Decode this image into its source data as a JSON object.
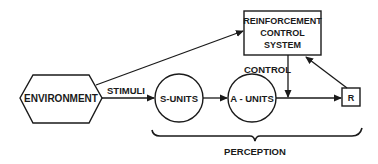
{
  "diagram": {
    "nodes": {
      "environment": {
        "label": "ENVIRONMENT",
        "shape": "hexagon"
      },
      "reinforcement": {
        "line1": "REINFORCEMENT",
        "line2": "CONTROL",
        "line3": "SYSTEM",
        "shape": "rectangle"
      },
      "s_units": {
        "label": "S-UNITS",
        "shape": "circle"
      },
      "a_units": {
        "label": "A - UNITS",
        "shape": "circle"
      },
      "r": {
        "label": "R",
        "shape": "square"
      }
    },
    "edges": {
      "stimuli": {
        "label": "STIMULI",
        "from": "environment",
        "to": "s_units"
      },
      "env_to_reinforcement": {
        "label": "",
        "from": "environment",
        "to": "reinforcement"
      },
      "s_to_a": {
        "label": "",
        "from": "s_units",
        "to": "a_units"
      },
      "a_to_r": {
        "label": "",
        "from": "a_units",
        "to": "r"
      },
      "control": {
        "label": "CONTROL",
        "from": "reinforcement",
        "to": "a_to_r"
      },
      "r_to_reinforcement": {
        "label": "",
        "from": "r",
        "to": "reinforcement"
      }
    },
    "brace": {
      "label": "PERCEPTION",
      "spans": [
        "s_units",
        "a_units",
        "r"
      ]
    },
    "colors": {
      "stroke": "#1a1a1a",
      "background": "#ffffff"
    }
  }
}
